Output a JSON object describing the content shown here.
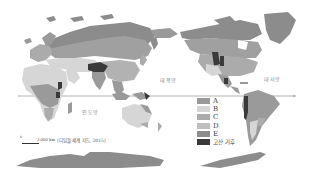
{
  "map": {
    "title": "",
    "ocean_labels": {
      "pacific": "태평양",
      "atlantic": "대서양",
      "indian": "인도양"
    },
    "legend": {
      "items": [
        {
          "label": "A",
          "color": "#9a9a9a"
        },
        {
          "label": "B",
          "color": "#d6d6d6"
        },
        {
          "label": "C",
          "color": "#ababab"
        },
        {
          "label": "D",
          "color": "#bfbfbf"
        },
        {
          "label": "E",
          "color": "#8c8c8c"
        },
        {
          "label": "고산 기후",
          "color": "#3a3a3a"
        }
      ]
    },
    "scale": {
      "zero": "0",
      "distance": "3,000 km"
    },
    "source": "(디딤돌 세계 지도, 2015)",
    "colors": {
      "land_a": "#9a9a9a",
      "land_b": "#d6d6d6",
      "land_c": "#ababab",
      "land_d": "#bfbfbf",
      "land_e": "#8c8c8c",
      "highland": "#3a3a3a",
      "equator": "#555555"
    }
  }
}
